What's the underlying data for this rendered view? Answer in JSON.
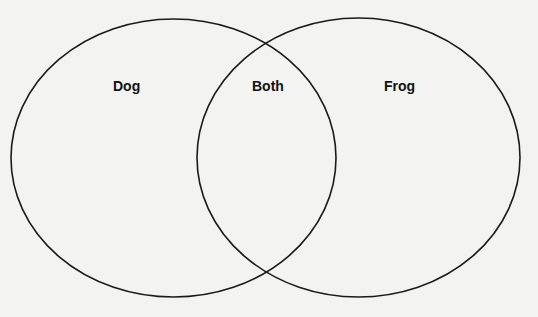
{
  "diagram": {
    "type": "venn",
    "sets": [
      {
        "id": "dog",
        "label": "Dog"
      },
      {
        "id": "frog",
        "label": "Frog"
      }
    ],
    "intersection": {
      "label": "Both"
    },
    "colors": {
      "outline": "#1a1a1a",
      "text": "#111111",
      "background": "#f3f3f1"
    }
  }
}
